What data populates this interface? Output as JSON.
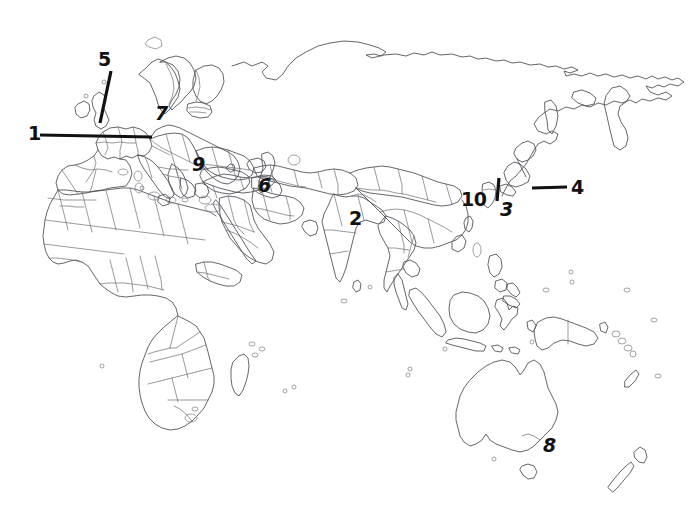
{
  "figure": {
    "background_color": "#ffffff",
    "coastline_color": "#4a4a52",
    "border_color": "#6d6d75",
    "label_color": "#111111",
    "width": 692,
    "height": 529
  },
  "labels": [
    {
      "id": "label-1",
      "text": "1",
      "x": 31,
      "y": 128,
      "leader": true,
      "region_hint": "Western Europe"
    },
    {
      "id": "label-5",
      "text": "5",
      "x": 98,
      "y": 52,
      "leader": true,
      "region_hint": "British Isles"
    },
    {
      "id": "label-7",
      "text": "7",
      "x": 155,
      "y": 106,
      "leader": false,
      "region_hint": "Central Europe"
    },
    {
      "id": "label-9",
      "text": "9",
      "x": 192,
      "y": 157,
      "leader": false,
      "region_hint": "Aegean / Greece"
    },
    {
      "id": "label-6",
      "text": "6",
      "x": 258,
      "y": 177,
      "leader": false,
      "region_hint": "Iran"
    },
    {
      "id": "label-2",
      "text": "2",
      "x": 348,
      "y": 210,
      "leader": false,
      "region_hint": "India"
    },
    {
      "id": "label-10",
      "text": "10",
      "x": 461,
      "y": 191,
      "leader": false,
      "region_hint": "China"
    },
    {
      "id": "label-3",
      "text": "3",
      "x": 500,
      "y": 202,
      "leader": true,
      "region_hint": "Korean Peninsula"
    },
    {
      "id": "label-4",
      "text": "4",
      "x": 570,
      "y": 180,
      "leader": true,
      "region_hint": "Japan"
    },
    {
      "id": "label-8",
      "text": "8",
      "x": 542,
      "y": 437,
      "leader": false,
      "region_hint": "Southeastern Australia"
    }
  ],
  "leader_lines": [
    {
      "id": "leader-1",
      "from_x": 40,
      "from_y": 135,
      "to_x": 152,
      "to_y": 137,
      "label": "1"
    },
    {
      "id": "leader-5",
      "from_x": 110,
      "from_y": 72,
      "to_x": 101,
      "to_y": 122,
      "label": "5"
    },
    {
      "id": "leader-3",
      "from_x": 499,
      "from_y": 179,
      "to_x": 497,
      "to_y": 200,
      "label": "3"
    },
    {
      "id": "leader-4",
      "from_x": 533,
      "from_y": 188,
      "to_x": 566,
      "to_y": 187,
      "label": "4"
    }
  ],
  "legend_note": ""
}
